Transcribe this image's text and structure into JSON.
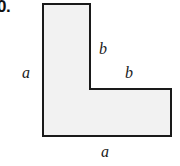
{
  "item": {
    "number": "0."
  },
  "figure": {
    "name": "l-shaped-polygon",
    "fill_color": "#f2f2f2",
    "stroke_color": "#1a1a1a",
    "stroke_width": 2,
    "points": "43,4 90,4 90,89 171,89 171,136 43,136",
    "labels": [
      {
        "id": "a-left",
        "text": "a"
      },
      {
        "id": "b-upper",
        "text": "b"
      },
      {
        "id": "b-lower",
        "text": "b"
      },
      {
        "id": "a-bottom",
        "text": "a"
      }
    ]
  }
}
